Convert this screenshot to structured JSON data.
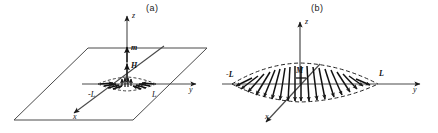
{
  "figure": {
    "panels": [
      {
        "id": "a",
        "label": "(a)",
        "axes": [
          {
            "name": "z-axis",
            "label": "z"
          },
          {
            "name": "y-axis",
            "label": "y"
          },
          {
            "name": "x-axis",
            "label": "x"
          }
        ],
        "vectors": [
          {
            "name": "magnetic-moment",
            "label": "m"
          },
          {
            "name": "field",
            "label": "H"
          }
        ],
        "extent_labels": [
          {
            "name": "negative-extent",
            "label": "-L"
          },
          {
            "name": "positive-extent",
            "label": "L"
          }
        ],
        "description": "point dipole on a plane"
      },
      {
        "id": "b",
        "label": "(b)",
        "axes": [
          {
            "name": "z-axis",
            "label": "z"
          },
          {
            "name": "y-axis",
            "label": "y"
          },
          {
            "name": "x-axis",
            "label": "x"
          }
        ],
        "vectors": [
          {
            "name": "magnetization",
            "label": "M"
          }
        ],
        "extent_labels": [
          {
            "name": "negative-extent",
            "label": "-L"
          },
          {
            "name": "positive-extent",
            "label": "L"
          }
        ],
        "description": "distributed magnetization profile within dashed lens envelope"
      }
    ],
    "colors": {
      "ink": "#1a1a1a",
      "line": "#3a3a3a",
      "background": "#ffffff"
    }
  }
}
